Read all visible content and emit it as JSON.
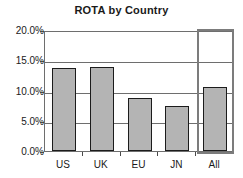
{
  "chart_data": {
    "type": "bar",
    "title": "ROTA by Country",
    "xlabel": "",
    "ylabel": "",
    "categories": [
      "US",
      "UK",
      "EU",
      "JN",
      "All"
    ],
    "values": [
      13.8,
      13.9,
      8.8,
      7.4,
      10.5
    ],
    "value_labels": [
      "13.8%",
      "13.9%",
      "8.8%",
      "7.4%",
      "10.5%"
    ],
    "ylim": [
      0.0,
      20.0
    ],
    "ytick_values": [
      0.0,
      5.0,
      10.0,
      15.0,
      20.0
    ],
    "ytick_labels": [
      "0.0%",
      "5.0%",
      "10.0%",
      "15.0%",
      "20.0%"
    ],
    "grid": true,
    "grid_axis": "y",
    "legend": false,
    "legend_position": "none",
    "bar_fill_color": "#b4b4b4",
    "bar_border_color": "#1c1c1c",
    "grid_color": "#6e6e6e",
    "axis_color": "#6e6e6e",
    "text_color": "#1a1a1a",
    "background_color": "#ffffff",
    "highlight": {
      "category": "All",
      "border_color": "#7c7c7c",
      "label": "All"
    }
  }
}
